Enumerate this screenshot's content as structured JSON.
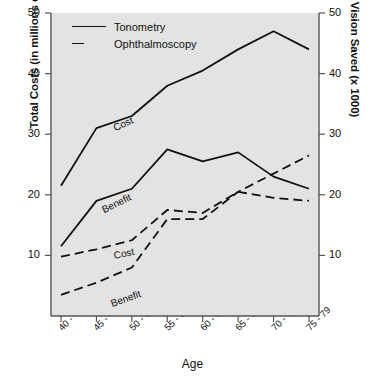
{
  "chart_data": {
    "type": "line",
    "title": "",
    "categories": [
      "40 - 44",
      "45 - 49",
      "50 - 54",
      "55 - 59",
      "60 - 64",
      "65 - 69",
      "70 - 74",
      "75 - 79"
    ],
    "xlabel": "Age",
    "ylabel": "Total Costs (in millions of dollars)",
    "ylabel_right": "Years of Vision Saved (x 1000)",
    "ylim": [
      0,
      50
    ],
    "ylim_right": [
      0,
      50
    ],
    "yticks": [
      10,
      20,
      30,
      40,
      50
    ],
    "yticks_right": [
      10,
      20,
      30,
      40,
      50
    ],
    "grid": false,
    "legend_position": "top-left",
    "legend": [
      "Tonometry",
      "Ophthalmoscopy"
    ],
    "series": [
      {
        "name": "Tonometry Cost",
        "style": "solid",
        "annotation": "Cost",
        "values": [
          21.5,
          31.0,
          33.0,
          38.0,
          40.5,
          44.0,
          47.0,
          44.0
        ]
      },
      {
        "name": "Tonometry Benefit",
        "style": "solid",
        "annotation": "Benefit",
        "values": [
          11.5,
          19.0,
          21.0,
          27.5,
          25.5,
          27.0,
          23.0,
          21.0
        ]
      },
      {
        "name": "Ophthalmoscopy Cost",
        "style": "dashed",
        "annotation": "Cost",
        "values": [
          9.8,
          11.0,
          12.5,
          17.5,
          17.0,
          20.5,
          19.5,
          19.0
        ]
      },
      {
        "name": "Ophthalmoscopy Benefit",
        "style": "dashed",
        "annotation": "Benefit",
        "values": [
          3.5,
          5.5,
          8.0,
          16.0,
          16.0,
          20.5,
          23.5,
          26.5
        ]
      }
    ],
    "colors": {
      "plot_background": "#e3e3e3",
      "line": "#111111",
      "axis": "#555555",
      "text": "#111111",
      "page_background": "#ffffff"
    }
  }
}
